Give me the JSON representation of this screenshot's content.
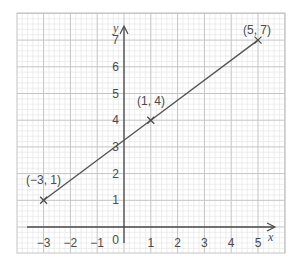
{
  "chart_data": {
    "type": "line",
    "title": "",
    "xlabel": "x",
    "ylabel": "y",
    "xlim": [
      -3.6,
      6.3
    ],
    "ylim": [
      -1,
      8.0
    ],
    "grid": true,
    "minor_grid_subdivisions": 5,
    "x_ticks": [
      -3,
      -2,
      -1,
      1,
      2,
      3,
      4,
      5
    ],
    "x_tick_labels": [
      "−3",
      "−2",
      "−1",
      "1",
      "2",
      "3",
      "4",
      "5"
    ],
    "y_ticks": [
      1,
      2,
      3,
      4,
      5,
      6,
      7
    ],
    "y_tick_labels": [
      "1",
      "2",
      "3",
      "4",
      "5",
      "6",
      "7"
    ],
    "origin_label": "0",
    "series": [
      {
        "name": "line",
        "x": [
          -3,
          1,
          5
        ],
        "y": [
          1,
          4,
          7
        ],
        "marker": "x",
        "color": "#4a4a4a"
      }
    ],
    "annotations": [
      {
        "text": "(−3, 1)",
        "x": -3,
        "y": 1
      },
      {
        "text": "(1, 4)",
        "x": 1,
        "y": 4
      },
      {
        "text": "(5, 7)",
        "x": 5,
        "y": 7
      }
    ]
  },
  "colors": {
    "minor_grid": "#e2e2e2",
    "major_grid": "#c4c4c4",
    "axis": "#4a4a4a",
    "line": "#555555"
  }
}
